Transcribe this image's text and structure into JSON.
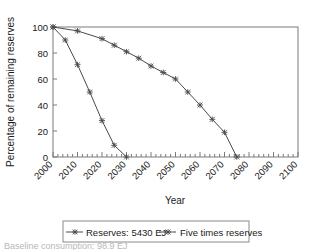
{
  "chart_data": {
    "type": "line",
    "title": "",
    "xlabel": "Year",
    "ylabel": "Percentage of remaining reserves",
    "xlim": [
      2000,
      2100
    ],
    "ylim": [
      0,
      100
    ],
    "xticks": [
      2000,
      2010,
      2020,
      2030,
      2040,
      2050,
      2060,
      2070,
      2080,
      2090,
      2100
    ],
    "xtick_labels": [
      "2000",
      "2010",
      "2020",
      "2030",
      "2040",
      "2050",
      "2060",
      "2070",
      "2080",
      "2090",
      "2100"
    ],
    "yticks": [
      0,
      20,
      40,
      60,
      80,
      100
    ],
    "ytick_labels": [
      "0",
      "20",
      "40",
      "60",
      "80",
      "100"
    ],
    "minor_xticks": true,
    "grid": false,
    "legend_position": "below",
    "series": [
      {
        "name": "Reserves: 5430 EJ",
        "marker": "x",
        "color": "#4a4a4a",
        "x": [
          2000,
          2005,
          2010,
          2015,
          2020,
          2025,
          2030
        ],
        "values": [
          100,
          90,
          71,
          50,
          28,
          9,
          0
        ],
        "x_end": 2030,
        "y_end": 0
      },
      {
        "name": "Five times reserves",
        "marker": "x",
        "color": "#4a4a4a",
        "x": [
          2000,
          2010,
          2020,
          2025,
          2030,
          2035,
          2040,
          2045,
          2050,
          2055,
          2060,
          2065,
          2070,
          2075
        ],
        "values": [
          100,
          97,
          91,
          86,
          81,
          76,
          70,
          65,
          60,
          50,
          40,
          29,
          19,
          0
        ],
        "x_end": 2075,
        "y_end": 0
      }
    ]
  },
  "axes": {
    "ylabel": "Percentage of remaining reserves",
    "xlabel": "Year",
    "ytick_labels": [
      "100",
      "80",
      "60",
      "40",
      "20",
      "0"
    ],
    "xtick_labels": [
      "2000",
      "2010",
      "2020",
      "2030",
      "2040",
      "2050",
      "2060",
      "2070",
      "2080",
      "2090",
      "2100"
    ]
  },
  "legend": {
    "entries": [
      {
        "label": "Reserves: 5430 EJ",
        "marker": "x"
      },
      {
        "label": "Five times reserves",
        "marker": "x"
      }
    ]
  },
  "caption": {
    "text": "Baseline consumption: 98.9 EJ"
  }
}
